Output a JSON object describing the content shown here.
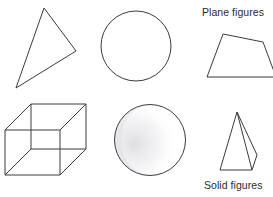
{
  "page": {
    "background_color": "#ffffff",
    "width": 273,
    "height": 197
  },
  "style": {
    "stroke_color": "#3a3a42",
    "text_color": "#2b2b2b",
    "shading_color": "#c9c9cf",
    "stroke_width": 1
  },
  "captions": {
    "plane": "Plane figures",
    "solid": "Solid figures"
  },
  "figures": {
    "plane_row": [
      {
        "name": "triangle",
        "type": "polygon",
        "points": "44,8 76,51 16,88"
      },
      {
        "name": "circle",
        "type": "circle",
        "cx": 136,
        "cy": 46,
        "r": 35
      },
      {
        "name": "trapezoid",
        "type": "polygon",
        "points": "223,34 263,42 276,77 207,77"
      }
    ],
    "solid_row": [
      {
        "name": "cube",
        "type": "wireframe-cube",
        "front_face": "5,130 60,130 60,175 5,175",
        "back_face": "31,104 86,104 86,149 31,149",
        "connectors": [
          "5,130 31,104",
          "60,130 86,104",
          "60,175 86,149",
          "5,175 31,149"
        ]
      },
      {
        "name": "sphere",
        "type": "shaded-circle",
        "cx": 150,
        "cy": 140,
        "r": 36,
        "shading": "left-crescent"
      },
      {
        "name": "pyramid",
        "type": "wireframe-pyramid",
        "front_triangle": "237,112 220,170 252,170",
        "back_edges": [
          "237,112 257,155",
          "257,155 252,170"
        ]
      }
    ]
  }
}
